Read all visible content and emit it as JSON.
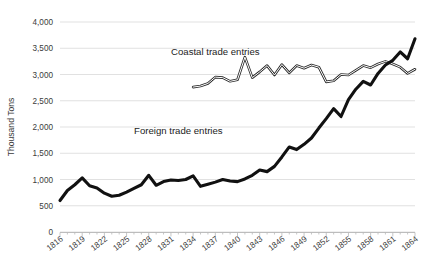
{
  "chart_data": {
    "type": "line",
    "title": "",
    "xlabel": "",
    "ylabel": "Thousand Tons",
    "ylim": [
      0,
      4000
    ],
    "xlim": [
      1816,
      1864
    ],
    "grid": true,
    "legend_position": "inline-annotation",
    "y_ticks": [
      "0",
      "500",
      "1,000",
      "1,500",
      "2,000",
      "2,500",
      "3,000",
      "3,500",
      "4,000"
    ],
    "y_tick_values": [
      0,
      500,
      1000,
      1500,
      2000,
      2500,
      3000,
      3500,
      4000
    ],
    "x_tick_labels": [
      "1816",
      "1819",
      "1822",
      "1825",
      "1828",
      "1831",
      "1834",
      "1837",
      "1840",
      "1843",
      "1846",
      "1849",
      "1852",
      "1855",
      "1858",
      "1861",
      "1864"
    ],
    "x_tick_values": [
      1816,
      1819,
      1822,
      1825,
      1828,
      1831,
      1834,
      1837,
      1840,
      1843,
      1846,
      1849,
      1852,
      1855,
      1858,
      1861,
      1864
    ],
    "x_all_years": [
      1816,
      1817,
      1818,
      1819,
      1820,
      1821,
      1822,
      1823,
      1824,
      1825,
      1826,
      1827,
      1828,
      1829,
      1830,
      1831,
      1832,
      1833,
      1834,
      1835,
      1836,
      1837,
      1838,
      1839,
      1840,
      1841,
      1842,
      1843,
      1844,
      1845,
      1846,
      1847,
      1848,
      1849,
      1850,
      1851,
      1852,
      1853,
      1854,
      1855,
      1856,
      1857,
      1858,
      1859,
      1860,
      1861,
      1862,
      1863,
      1864
    ],
    "annotations": [
      {
        "text": "Coastal trade entries",
        "x": 1837,
        "y": 3370
      },
      {
        "text": "Foreign trade entries",
        "x": 1832,
        "y": 1860
      }
    ],
    "series": [
      {
        "name": "Foreign trade entries",
        "color": "#111111",
        "style": "thick-solid",
        "x": [
          1816,
          1817,
          1818,
          1819,
          1820,
          1821,
          1822,
          1823,
          1824,
          1825,
          1826,
          1827,
          1828,
          1829,
          1830,
          1831,
          1832,
          1833,
          1834,
          1835,
          1836,
          1837,
          1838,
          1839,
          1840,
          1841,
          1842,
          1843,
          1844,
          1845,
          1846,
          1847,
          1848,
          1849,
          1850,
          1851,
          1852,
          1853,
          1854,
          1855,
          1856,
          1857,
          1858,
          1859,
          1860,
          1861,
          1862,
          1863,
          1864
        ],
        "values": [
          600,
          790,
          900,
          1030,
          880,
          840,
          740,
          680,
          700,
          760,
          830,
          900,
          1080,
          890,
          960,
          990,
          980,
          1000,
          1070,
          870,
          910,
          950,
          1000,
          970,
          960,
          1010,
          1080,
          1180,
          1150,
          1250,
          1430,
          1620,
          1570,
          1670,
          1790,
          1980,
          2160,
          2350,
          2200,
          2520,
          2720,
          2870,
          2800,
          3020,
          3180,
          3270,
          3430,
          3300,
          3680
        ]
      },
      {
        "name": "Coastal trade entries",
        "color": "#2b2b2b",
        "style": "double-line",
        "x": [
          1834,
          1835,
          1836,
          1837,
          1838,
          1839,
          1840,
          1841,
          1842,
          1843,
          1844,
          1845,
          1846,
          1847,
          1848,
          1849,
          1850,
          1851,
          1852,
          1853,
          1854,
          1855,
          1856,
          1857,
          1858,
          1859,
          1860,
          1861,
          1862,
          1863,
          1864
        ],
        "values": [
          2760,
          2780,
          2830,
          2950,
          2940,
          2870,
          2900,
          3330,
          2940,
          3050,
          3170,
          2990,
          3190,
          3030,
          3170,
          3120,
          3180,
          3140,
          2860,
          2880,
          3000,
          2990,
          3080,
          3170,
          3130,
          3200,
          3250,
          3200,
          3140,
          3020,
          3100
        ]
      }
    ]
  }
}
